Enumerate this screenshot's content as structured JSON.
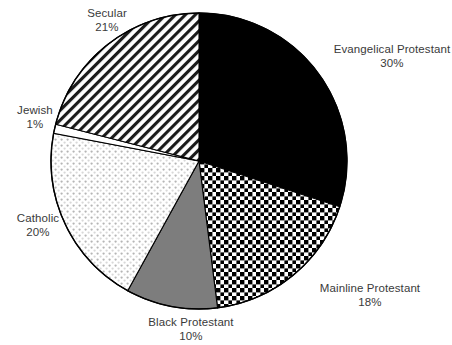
{
  "chart_data": {
    "type": "pie",
    "title": "",
    "subtitle": "",
    "xlabel": "",
    "ylabel": "",
    "legend_position": "none",
    "grid": false,
    "labels_show_percent": true,
    "start_angle_deg": 0,
    "direction": "clockwise",
    "categories": [
      "Evangelical Protestant",
      "Mainline Protestant",
      "Black Protestant",
      "Catholic",
      "Jewish",
      "Secular"
    ],
    "values": [
      30,
      18,
      10,
      20,
      1,
      21
    ],
    "slices": [
      {
        "label": "Evangelical Protestant",
        "percent": "30%",
        "value": 30,
        "fill_style": "solid-black",
        "fill_color": "#000000"
      },
      {
        "label": "Mainline Protestant",
        "percent": "18%",
        "value": 18,
        "fill_style": "checkerboard",
        "fill_color": "#000000"
      },
      {
        "label": "Black Protestant",
        "percent": "10%",
        "value": 10,
        "fill_style": "solid-gray",
        "fill_color": "#7d7d7d"
      },
      {
        "label": "Catholic",
        "percent": "20%",
        "value": 20,
        "fill_style": "fine-dots",
        "fill_color": "#bdbdbd"
      },
      {
        "label": "Jewish",
        "percent": "1%",
        "value": 1,
        "fill_style": "blank-white",
        "fill_color": "#ffffff"
      },
      {
        "label": "Secular",
        "percent": "21%",
        "value": 21,
        "fill_style": "diagonal-hatch",
        "fill_color": "#1a1a1a"
      }
    ]
  },
  "labels": {
    "secular": {
      "name": "Secular",
      "percent": "21%"
    },
    "evangelical": {
      "name": "Evangelical Protestant",
      "percent": "30%"
    },
    "mainline": {
      "name": "Mainline Protestant",
      "percent": "18%"
    },
    "black": {
      "name": "Black Protestant",
      "percent": "10%"
    },
    "catholic": {
      "name": "Catholic",
      "percent": "20%"
    },
    "jewish": {
      "name": "Jewish",
      "percent": "1%"
    }
  },
  "colors": {
    "outline": "#000000",
    "text": "#3a3a3a",
    "background": "#ffffff"
  }
}
